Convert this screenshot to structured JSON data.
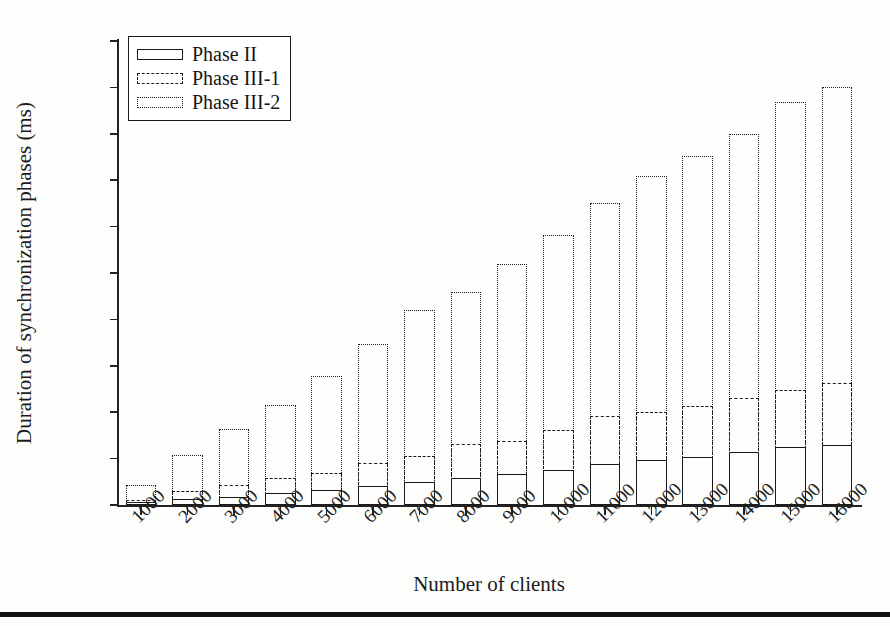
{
  "chart_data": {
    "type": "bar",
    "subtype": "stacked-bar",
    "title": "",
    "xlabel": "Number of clients",
    "ylabel": "Duration of synchronization phases (ms)",
    "categories": [
      "1000",
      "2000",
      "3000",
      "4000",
      "5000",
      "6000",
      "7000",
      "8000",
      "9000",
      "10000",
      "11000",
      "12000",
      "13000",
      "14000",
      "15000",
      "16000"
    ],
    "series": [
      {
        "name": "Phase II",
        "style": "solid",
        "values": [
          3,
          6,
          9,
          13,
          16,
          20,
          25,
          29,
          33,
          38,
          44,
          48,
          52,
          57,
          62,
          65
        ]
      },
      {
        "name": "Phase III-1",
        "style": "dashed",
        "values": [
          2,
          9,
          13,
          16,
          19,
          25,
          28,
          37,
          36,
          43,
          52,
          52,
          55,
          58,
          62,
          67
        ]
      },
      {
        "name": "Phase III-2",
        "style": "dotted",
        "values": [
          17,
          39,
          60,
          79,
          104,
          129,
          157,
          164,
          191,
          210,
          229,
          255,
          269,
          285,
          310,
          318
        ]
      }
    ],
    "cumulative_tops": {
      "phase_II": [
        3,
        6,
        9,
        13,
        16,
        20,
        25,
        29,
        33,
        38,
        44,
        48,
        52,
        57,
        62,
        65
      ],
      "phase_III_1": [
        5,
        15,
        22,
        29,
        35,
        45,
        53,
        66,
        69,
        81,
        96,
        100,
        107,
        115,
        124,
        132
      ],
      "phase_III_2": [
        22,
        54,
        82,
        108,
        139,
        174,
        210,
        230,
        260,
        291,
        325,
        355,
        376,
        400,
        434,
        450
      ]
    },
    "ylim": [
      0,
      500
    ],
    "ytick_step": 50,
    "yticks": [
      0,
      50,
      100,
      150,
      200,
      250,
      300,
      350,
      400,
      450,
      500
    ],
    "grid": false,
    "legend_position": "top-left",
    "axis_color": "#1a1a1a"
  },
  "legend": {
    "entries": [
      {
        "label": "Phase II",
        "swatch": "legend-swatch-solid"
      },
      {
        "label": "Phase III-1",
        "swatch": "legend-swatch-dashed"
      },
      {
        "label": "Phase III-2",
        "swatch": "legend-swatch-dotted"
      }
    ]
  },
  "axes": {
    "y_title": "Duration of synchronization phases (ms)",
    "x_title": "Number of clients"
  }
}
